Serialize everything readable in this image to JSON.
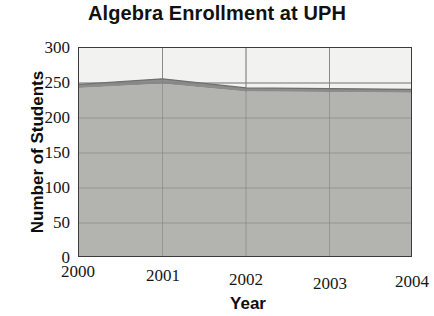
{
  "chart_data": {
    "type": "area",
    "title": "Algebra Enrollment at UPH",
    "subtitle": "",
    "xlabel": "Year",
    "ylabel": "Number of Students",
    "stacked": true,
    "grid": true,
    "legend_position": "none",
    "x": [
      2000,
      2001,
      2002,
      2003,
      2004
    ],
    "categories": [
      "2000",
      "2001",
      "2002",
      "2003",
      "2004"
    ],
    "xtick_labels": [
      "2000",
      "2001",
      "2002",
      "2003",
      "2004"
    ],
    "ytick_labels": [
      "300",
      "250",
      "200",
      "150",
      "100",
      "50",
      "0"
    ],
    "ytick_values": [
      300,
      250,
      200,
      150,
      100,
      50,
      0
    ],
    "xlim": [
      2000,
      2004
    ],
    "ylim": [
      0,
      300
    ],
    "series": [
      {
        "name": "Lower band",
        "color": "#b3b3b0",
        "values": [
          243,
          249,
          238,
          237,
          236
        ]
      },
      {
        "name": "Upper band",
        "color": "#8c8c8a",
        "values": [
          5,
          7,
          5,
          5,
          5
        ]
      }
    ],
    "totals": [
      248,
      256,
      243,
      242,
      241
    ],
    "annotations": []
  },
  "colors": {
    "plot_background": "#f2f2f0",
    "axis": "#3b3b3b",
    "gridline": "#9a9a98",
    "area_lower": "#b3b3b0",
    "area_upper": "#8c8c8a",
    "text": "#111111"
  }
}
